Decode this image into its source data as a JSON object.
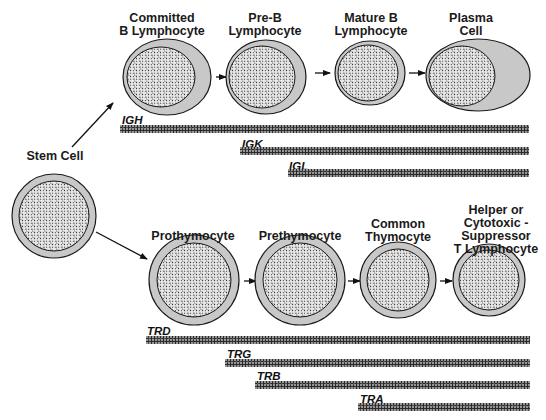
{
  "diagram": {
    "title": "",
    "colors": {
      "cytoplasm": "#c8c8c8",
      "outline": "#1a1a1a",
      "nucleus_fill": "#e6e6e6",
      "nucleus_speckle": "#222222",
      "gene_bar": "#2a2a2a",
      "background": "#ffffff"
    },
    "stem_cell": {
      "label": "Stem Cell"
    },
    "b_lineage": {
      "cells": [
        {
          "label": "Committed\nB Lymphocyte"
        },
        {
          "label": "Pre-B\nLymphocyte"
        },
        {
          "label": "Mature B\nLymphocyte"
        },
        {
          "label": "Plasma\nCell"
        }
      ],
      "genes": [
        {
          "name": "IGH",
          "starts_at_stage": 1
        },
        {
          "name": "IGK",
          "starts_at_stage": 2
        },
        {
          "name": "IGL",
          "starts_at_stage": 2
        }
      ]
    },
    "t_lineage": {
      "cells": [
        {
          "label": "Prothymocyte"
        },
        {
          "label": "Prethymocyte"
        },
        {
          "label": "Common\nThymocyte"
        },
        {
          "label": "Helper or\nCytotoxic -\nSuppressor\nT Lymphocyte"
        }
      ],
      "genes": [
        {
          "name": "TRD",
          "starts_at_stage": 1
        },
        {
          "name": "TRG",
          "starts_at_stage": 2
        },
        {
          "name": "TRB",
          "starts_at_stage": 2
        },
        {
          "name": "TRA",
          "starts_at_stage": 3
        }
      ]
    }
  }
}
